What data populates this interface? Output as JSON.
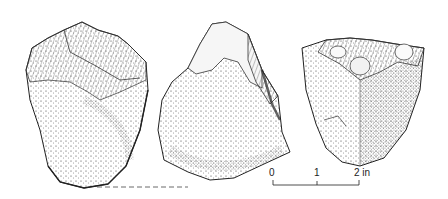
{
  "figure": {
    "artifacts": [
      {
        "id": "artifact-1",
        "view": "left"
      },
      {
        "id": "artifact-2",
        "view": "center"
      },
      {
        "id": "artifact-3",
        "view": "right"
      }
    ],
    "scale_bar": {
      "ticks": [
        "0",
        "1",
        "2 in"
      ],
      "unit": "in"
    }
  }
}
